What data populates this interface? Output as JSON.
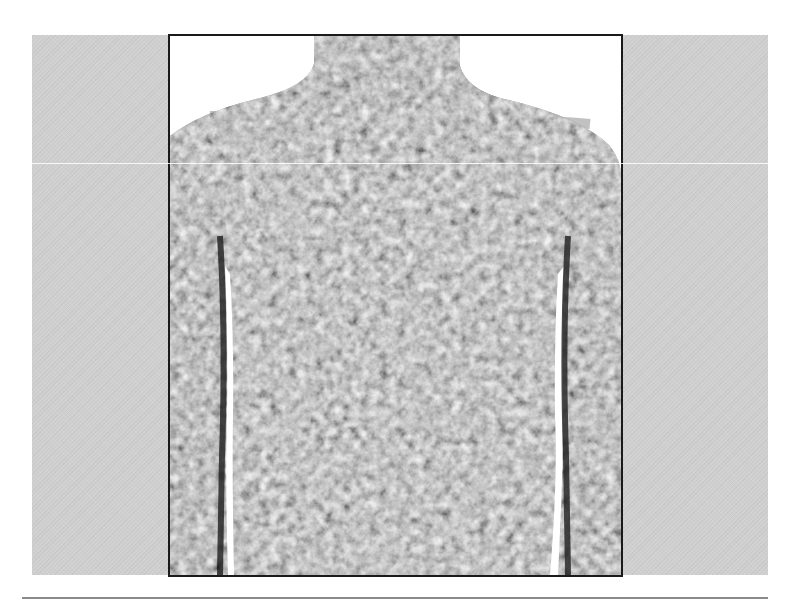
{
  "figure": {
    "background_color": "#d0d0d0",
    "frame_border_color": "#1a1a1a",
    "skin_tone_base": "#9a9a9a",
    "skin_tone_dark": "#5a5a5a",
    "skin_tone_light": "#c4c4c4",
    "rule_color": "#8a8a8a"
  },
  "caption": ""
}
